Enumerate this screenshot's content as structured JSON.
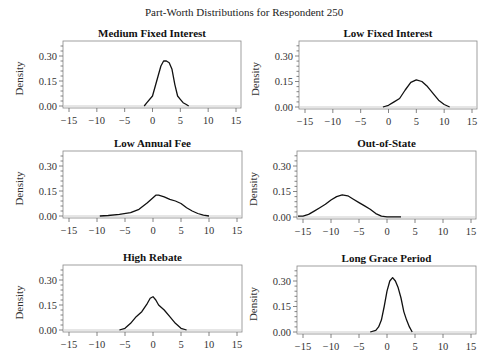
{
  "figure": {
    "title": "Part-Worth Distributions for Respondent 250"
  },
  "chart_data": [
    {
      "type": "line",
      "title": "Medium Fixed Interest",
      "xlabel": "",
      "ylabel": "Density",
      "xlim": [
        -16,
        16
      ],
      "ylim": [
        0,
        0.36
      ],
      "xticks": [
        -15,
        -10,
        -5,
        0,
        5,
        10,
        15
      ],
      "yticks": [
        0.0,
        0.15,
        0.3
      ],
      "grid": false,
      "x": [
        -1.5,
        -1,
        0,
        0.5,
        1,
        1.5,
        2,
        2.5,
        3,
        3.5,
        4,
        4.5,
        5,
        5.5,
        6,
        6.5
      ],
      "y": [
        0.0,
        0.02,
        0.06,
        0.12,
        0.18,
        0.24,
        0.27,
        0.27,
        0.26,
        0.22,
        0.13,
        0.06,
        0.04,
        0.02,
        0.01,
        0.0
      ]
    },
    {
      "type": "line",
      "title": "Low Fixed Interest",
      "xlabel": "",
      "ylabel": "Density",
      "xlim": [
        -16,
        16
      ],
      "ylim": [
        0,
        0.36
      ],
      "xticks": [
        -15,
        -10,
        -5,
        0,
        5,
        10,
        15
      ],
      "yticks": [
        0.0,
        0.15,
        0.3
      ],
      "grid": false,
      "x": [
        -1,
        0,
        1,
        2,
        3,
        4,
        5,
        6,
        7,
        8,
        9,
        10,
        11
      ],
      "y": [
        0.0,
        0.01,
        0.03,
        0.05,
        0.1,
        0.145,
        0.16,
        0.15,
        0.12,
        0.08,
        0.04,
        0.015,
        0.0
      ]
    },
    {
      "type": "line",
      "title": "Low Annual Fee",
      "xlabel": "",
      "ylabel": "Density",
      "xlim": [
        -16,
        16
      ],
      "ylim": [
        0,
        0.36
      ],
      "xticks": [
        -15,
        -10,
        -5,
        0,
        5,
        10,
        15
      ],
      "yticks": [
        0.0,
        0.15,
        0.3
      ],
      "grid": false,
      "x": [
        -9.5,
        -8,
        -6,
        -4,
        -2.5,
        -1,
        0,
        0.5,
        1,
        2,
        3,
        4,
        5,
        6,
        7,
        8,
        9,
        10
      ],
      "y": [
        0.0,
        0.003,
        0.01,
        0.02,
        0.04,
        0.08,
        0.11,
        0.125,
        0.125,
        0.115,
        0.1,
        0.09,
        0.075,
        0.05,
        0.03,
        0.015,
        0.005,
        0.0
      ]
    },
    {
      "type": "line",
      "title": "Out-of-State",
      "xlabel": "",
      "ylabel": "Density",
      "xlim": [
        -16,
        16
      ],
      "ylim": [
        0,
        0.36
      ],
      "xticks": [
        -15,
        -10,
        -5,
        0,
        5,
        10,
        15
      ],
      "yticks": [
        0.0,
        0.15,
        0.3
      ],
      "grid": false,
      "x": [
        -16,
        -15,
        -14,
        -13,
        -12,
        -11,
        -10,
        -9,
        -8,
        -7,
        -6,
        -5,
        -4,
        -3,
        -2,
        -1,
        0,
        1,
        2.5
      ],
      "y": [
        0.005,
        0.005,
        0.015,
        0.035,
        0.055,
        0.075,
        0.1,
        0.12,
        0.13,
        0.125,
        0.105,
        0.085,
        0.065,
        0.045,
        0.02,
        0.005,
        0.001,
        0.001,
        0.001
      ]
    },
    {
      "type": "line",
      "title": "High Rebate",
      "xlabel": "",
      "ylabel": "Density",
      "xlim": [
        -16,
        16
      ],
      "ylim": [
        0,
        0.36
      ],
      "xticks": [
        -15,
        -10,
        -5,
        0,
        5,
        10,
        15
      ],
      "yticks": [
        0.0,
        0.15,
        0.3
      ],
      "grid": false,
      "x": [
        -6,
        -5,
        -4,
        -3,
        -2,
        -1,
        -0.5,
        0,
        0.5,
        1,
        2,
        3,
        4,
        5,
        6
      ],
      "y": [
        0.0,
        0.01,
        0.04,
        0.08,
        0.11,
        0.16,
        0.19,
        0.2,
        0.18,
        0.15,
        0.12,
        0.08,
        0.04,
        0.01,
        0.0
      ]
    },
    {
      "type": "line",
      "title": "Long Grace Period",
      "xlabel": "",
      "ylabel": "Density",
      "xlim": [
        -16,
        16
      ],
      "ylim": [
        0,
        0.36
      ],
      "xticks": [
        -15,
        -10,
        -5,
        0,
        5,
        10,
        15
      ],
      "yticks": [
        0.0,
        0.15,
        0.3
      ],
      "grid": false,
      "x": [
        -3,
        -2,
        -1.5,
        -1,
        -0.5,
        0,
        0.5,
        1,
        1.5,
        2,
        2.5,
        3,
        3.5,
        4,
        4.5
      ],
      "y": [
        0.0,
        0.01,
        0.03,
        0.07,
        0.15,
        0.24,
        0.3,
        0.32,
        0.3,
        0.26,
        0.2,
        0.12,
        0.07,
        0.03,
        0.0
      ]
    }
  ],
  "layout": {
    "panels": [
      {
        "left": 63,
        "top": 41,
        "width": 178,
        "height": 67
      },
      {
        "left": 299,
        "top": 41,
        "width": 178,
        "height": 68
      },
      {
        "left": 63,
        "top": 151,
        "width": 179,
        "height": 67
      },
      {
        "left": 297,
        "top": 151,
        "width": 179,
        "height": 68
      },
      {
        "left": 63,
        "top": 265,
        "width": 179,
        "height": 67
      },
      {
        "left": 297,
        "top": 266,
        "width": 179,
        "height": 68
      }
    ],
    "line_color": "#111111",
    "frame_color": "#888888",
    "baseline_color": "#cccccc"
  }
}
